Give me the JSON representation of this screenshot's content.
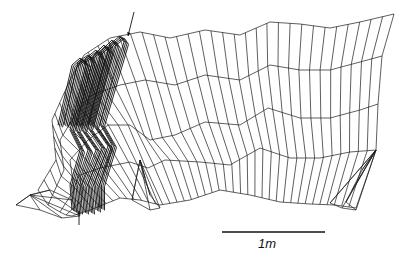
{
  "figure": {
    "type": "wireframe-perspective-surface",
    "background": "#ffffff",
    "ink_color": "#111111",
    "scale_bar": {
      "label": "1m",
      "x1": 222,
      "x2": 325,
      "y": 232,
      "label_x": 258,
      "label_y": 236
    },
    "arrows": [
      {
        "name": "top-arrow",
        "x1": 134,
        "y1": 12,
        "x2": 128,
        "y2": 36
      },
      {
        "name": "bottom-arrow",
        "x1": 79,
        "y1": 225,
        "x2": 79,
        "y2": 211
      }
    ],
    "profiles": [
      [
        [
          38,
          190
        ],
        [
          56,
          160
        ],
        [
          52,
          120
        ],
        [
          70,
          80
        ],
        [
          84,
          55
        ],
        [
          110,
          38
        ],
        [
          140,
          32
        ],
        [
          170,
          38
        ],
        [
          205,
          30
        ],
        [
          240,
          35
        ],
        [
          270,
          22
        ],
        [
          300,
          24
        ],
        [
          330,
          28
        ],
        [
          360,
          22
        ],
        [
          394,
          14
        ]
      ],
      [
        [
          48,
          205
        ],
        [
          64,
          170
        ],
        [
          60,
          140
        ],
        [
          78,
          110
        ],
        [
          92,
          95
        ],
        [
          120,
          85
        ],
        [
          145,
          80
        ],
        [
          175,
          85
        ],
        [
          205,
          75
        ],
        [
          240,
          80
        ],
        [
          270,
          65
        ],
        [
          300,
          70
        ],
        [
          330,
          70
        ],
        [
          360,
          62
        ],
        [
          382,
          56
        ]
      ],
      [
        [
          60,
          212
        ],
        [
          74,
          190
        ],
        [
          70,
          160
        ],
        [
          88,
          140
        ],
        [
          108,
          125
        ],
        [
          130,
          125
        ],
        [
          150,
          140
        ],
        [
          175,
          135
        ],
        [
          205,
          122
        ],
        [
          240,
          125
        ],
        [
          268,
          108
        ],
        [
          300,
          118
        ],
        [
          330,
          118
        ],
        [
          360,
          110
        ],
        [
          378,
          104
        ]
      ],
      [
        [
          66,
          215
        ],
        [
          82,
          200
        ],
        [
          80,
          175
        ],
        [
          100,
          168
        ],
        [
          130,
          162
        ],
        [
          148,
          168
        ],
        [
          165,
          160
        ],
        [
          200,
          162
        ],
        [
          230,
          165
        ],
        [
          260,
          148
        ],
        [
          290,
          158
        ],
        [
          320,
          158
        ],
        [
          350,
          152
        ],
        [
          376,
          150
        ]
      ],
      [
        [
          72,
          216
        ],
        [
          90,
          210
        ],
        [
          120,
          198
        ],
        [
          140,
          200
        ],
        [
          160,
          205
        ],
        [
          190,
          200
        ],
        [
          220,
          190
        ],
        [
          250,
          195
        ],
        [
          280,
          202
        ],
        [
          310,
          204
        ],
        [
          335,
          205
        ],
        [
          356,
          208
        ]
      ]
    ],
    "dense_strands": [
      [
        [
          58,
          125
        ],
        [
          72,
          65
        ],
        [
          80,
          58
        ],
        [
          86,
          65
        ],
        [
          70,
          130
        ],
        [
          80,
          150
        ],
        [
          70,
          185
        ],
        [
          72,
          210
        ]
      ],
      [
        [
          64,
          125
        ],
        [
          78,
          62
        ],
        [
          88,
          55
        ],
        [
          92,
          62
        ],
        [
          76,
          130
        ],
        [
          88,
          150
        ],
        [
          76,
          185
        ],
        [
          78,
          212
        ]
      ],
      [
        [
          70,
          125
        ],
        [
          86,
          58
        ],
        [
          96,
          50
        ],
        [
          100,
          58
        ],
        [
          82,
          130
        ],
        [
          96,
          150
        ],
        [
          82,
          185
        ],
        [
          84,
          212
        ]
      ],
      [
        [
          76,
          125
        ],
        [
          94,
          55
        ],
        [
          104,
          45
        ],
        [
          108,
          52
        ],
        [
          88,
          128
        ],
        [
          102,
          148
        ],
        [
          88,
          185
        ],
        [
          90,
          212
        ]
      ],
      [
        [
          82,
          125
        ],
        [
          102,
          50
        ],
        [
          112,
          40
        ],
        [
          116,
          46
        ],
        [
          94,
          126
        ],
        [
          108,
          146
        ],
        [
          94,
          185
        ],
        [
          96,
          210
        ]
      ],
      [
        [
          88,
          124
        ],
        [
          110,
          44
        ],
        [
          120,
          36
        ],
        [
          124,
          42
        ],
        [
          100,
          124
        ],
        [
          112,
          145
        ],
        [
          100,
          184
        ],
        [
          100,
          208
        ]
      ]
    ],
    "feet": [
      {
        "name": "left-foot",
        "points": [
          [
            16,
            205
          ],
          [
            40,
            210
          ],
          [
            62,
            218
          ],
          [
            80,
            216
          ],
          [
            72,
            200
          ],
          [
            50,
            190
          ],
          [
            30,
            195
          ]
        ]
      },
      {
        "name": "middle-foot",
        "points": [
          [
            132,
            200
          ],
          [
            150,
            210
          ],
          [
            160,
            208
          ],
          [
            150,
            195
          ],
          [
            145,
            178
          ],
          [
            140,
            160
          ]
        ]
      },
      {
        "name": "right-foot",
        "points": [
          [
            330,
            203
          ],
          [
            342,
            208
          ],
          [
            356,
            210
          ],
          [
            346,
            202
          ],
          [
            352,
            190
          ],
          [
            362,
            170
          ],
          [
            376,
            150
          ]
        ]
      }
    ],
    "columns": 40
  }
}
